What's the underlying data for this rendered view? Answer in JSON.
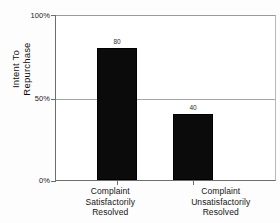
{
  "chart_data": {
    "type": "bar",
    "title": "",
    "xlabel": "",
    "ylabel": "Intent To Repurchase",
    "ylabel_lines": [
      "Intent To",
      "Repurchase"
    ],
    "categories": [
      "Complaint Satisfactorily Resolved",
      "Complaint Unsatisfactorily Resolved"
    ],
    "category_lines": [
      [
        "Complaint",
        "Satisfactorily",
        "Resolved"
      ],
      [
        "Complaint",
        "Unsatisfactorily",
        "Resolved"
      ]
    ],
    "values": [
      80,
      40
    ],
    "value_labels": [
      "80",
      "40"
    ],
    "ylim": [
      0,
      100
    ],
    "yticks": [
      0,
      50,
      100
    ],
    "ytick_labels": [
      "0%",
      "50%",
      "100%"
    ],
    "grid": true,
    "gridlines_at": [
      50
    ],
    "legend": null,
    "bar_color": "#0b0b0b",
    "grid_color": "#a6a6a6",
    "axis_color": "#6e6e6e",
    "background_color": "#ffffff"
  }
}
